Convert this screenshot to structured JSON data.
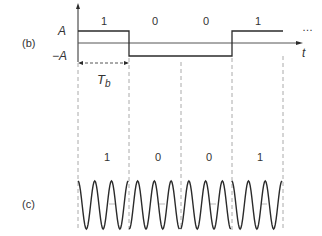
{
  "panel_b": {
    "label": "(b)",
    "level_high": "A",
    "level_low": "−A",
    "time_axis": "t",
    "ellipsis": "…",
    "bit_period_label": "T",
    "bit_period_sub": "b",
    "bits": [
      "1",
      "0",
      "0",
      "1"
    ]
  },
  "panel_c": {
    "label": "(c)",
    "bits": [
      "1",
      "0",
      "0",
      "1"
    ]
  },
  "colors": {
    "line": "#2b2b2b",
    "dashed": "#aaaaaa",
    "text": "#333333"
  }
}
